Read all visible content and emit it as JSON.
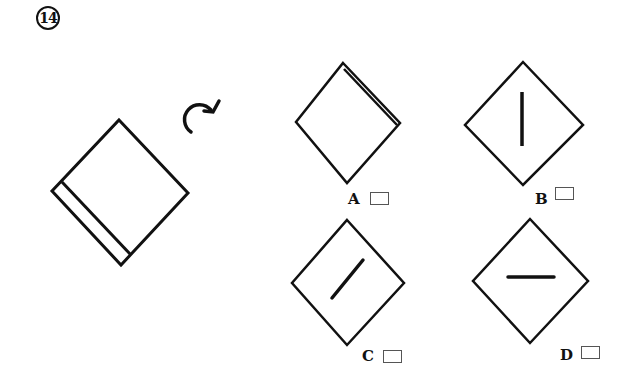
{
  "question": {
    "number_label": "14",
    "number_icon": "circled-number-icon"
  },
  "figure": {
    "main_shape": "square-with-inner-strip",
    "rotation_arrow": "clockwise-rotation-arrow-icon",
    "stroke_color": "#111111"
  },
  "options": [
    {
      "label": "A",
      "shape": "diamond-with-double-edge-top-right",
      "checked": false
    },
    {
      "label": "B",
      "shape": "diamond-with-vertical-line",
      "checked": false
    },
    {
      "label": "C",
      "shape": "diamond-with-diagonal-line",
      "checked": false
    },
    {
      "label": "D",
      "shape": "diamond-with-horizontal-line",
      "checked": false
    }
  ]
}
